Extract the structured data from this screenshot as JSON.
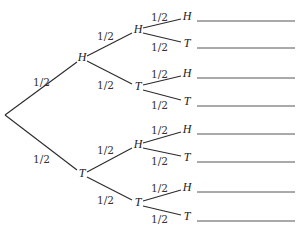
{
  "diagram": {
    "type": "probability-tree",
    "root": {
      "x": 5,
      "y": 115
    },
    "level1": [
      {
        "label": "H",
        "x": 82,
        "y": 58,
        "prob": "1/2",
        "prob_pos": [
          33,
          83
        ]
      },
      {
        "label": "T",
        "x": 82,
        "y": 174,
        "prob": "1/2",
        "prob_pos": [
          33,
          160
        ]
      }
    ],
    "level2": [
      {
        "label": "H",
        "x": 138,
        "y": 30,
        "prob": "1/2",
        "prob_pos": [
          97,
          37
        ]
      },
      {
        "label": "T",
        "x": 138,
        "y": 87,
        "prob": "1/2",
        "prob_pos": [
          97,
          86
        ]
      },
      {
        "label": "H",
        "x": 138,
        "y": 145,
        "prob": "1/2",
        "prob_pos": [
          97,
          151
        ]
      },
      {
        "label": "T",
        "x": 138,
        "y": 203,
        "prob": "1/2",
        "prob_pos": [
          97,
          201
        ]
      }
    ],
    "leaves": [
      {
        "label": "H",
        "x": 187,
        "y": 17,
        "prob": "1/2",
        "prob_pos": [
          151,
          18
        ]
      },
      {
        "label": "T",
        "x": 187,
        "y": 44,
        "prob": "1/2",
        "prob_pos": [
          151,
          48
        ]
      },
      {
        "label": "H",
        "x": 187,
        "y": 74,
        "prob": "1/2",
        "prob_pos": [
          151,
          75
        ]
      },
      {
        "label": "T",
        "x": 187,
        "y": 102,
        "prob": "1/2",
        "prob_pos": [
          151,
          106
        ]
      },
      {
        "label": "H",
        "x": 187,
        "y": 130,
        "prob": "1/2",
        "prob_pos": [
          151,
          131
        ]
      },
      {
        "label": "T",
        "x": 187,
        "y": 158,
        "prob": "1/2",
        "prob_pos": [
          151,
          162
        ]
      },
      {
        "label": "H",
        "x": 187,
        "y": 188,
        "prob": "1/2",
        "prob_pos": [
          151,
          189
        ]
      },
      {
        "label": "T",
        "x": 187,
        "y": 217,
        "prob": "1/2",
        "prob_pos": [
          151,
          220
        ]
      }
    ],
    "answer_blank": {
      "x1": 197,
      "x2": 295
    }
  }
}
